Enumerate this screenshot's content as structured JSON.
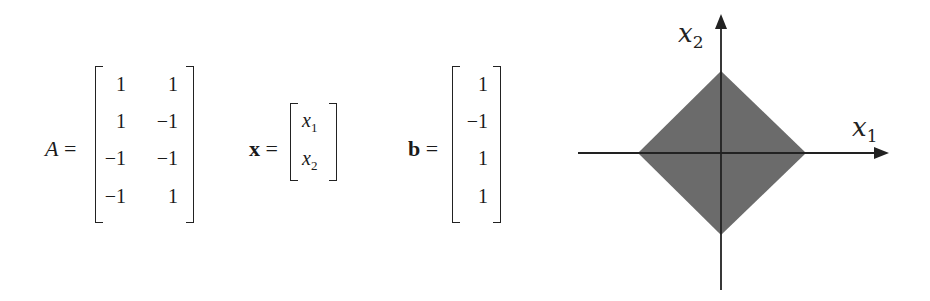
{
  "equations": {
    "matrix_A": {
      "label": "A",
      "equals": "=",
      "rows": [
        [
          "1",
          "1"
        ],
        [
          "1",
          "−1"
        ],
        [
          "−1",
          "−1"
        ],
        [
          "−1",
          "1"
        ]
      ]
    },
    "vector_x": {
      "label": "x",
      "equals": "=",
      "entries": [
        {
          "base": "x",
          "sub": "1"
        },
        {
          "base": "x",
          "sub": "2"
        }
      ]
    },
    "vector_b": {
      "label": "b",
      "equals": "=",
      "entries": [
        "1",
        "−1",
        "1",
        "1"
      ]
    }
  },
  "plot": {
    "x_axis_label": {
      "base": "x",
      "sub": "1"
    },
    "y_axis_label": {
      "base": "x",
      "sub": "2"
    },
    "region": "feasible region |x1| + |x2| <= 1 (diamond)",
    "fill_color": "#6b6b6b",
    "axis_color": "#222222"
  }
}
